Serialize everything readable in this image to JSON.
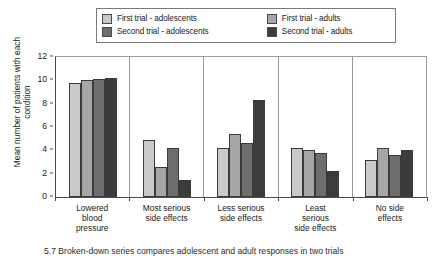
{
  "legend": {
    "entries": [
      {
        "label": "First trial - adolescents",
        "color": "#c9c9c9",
        "key": "first_adolescents"
      },
      {
        "label": "First trial - adults",
        "color": "#a6a6a6",
        "key": "first_adults"
      },
      {
        "label": "Second trial - adolescents",
        "color": "#6e6e6e",
        "key": "second_adolescents"
      },
      {
        "label": "Second trial - adults",
        "color": "#3c3c3c",
        "key": "second_adults"
      }
    ]
  },
  "caption": {
    "text": "5.7  Broken-down series compares adolescent and adult responses in two trials"
  },
  "chart_data": {
    "type": "bar",
    "title": "",
    "xlabel": "",
    "ylabel": "Mean number of patients with each condition",
    "ylim": [
      0,
      12
    ],
    "yticks": [
      0,
      2,
      4,
      6,
      8,
      10,
      12
    ],
    "grid": false,
    "legend_position": "top",
    "categories": [
      "Lowered blood pressure",
      "Most serious side effects",
      "Less serious side effects",
      "Least serious side effects",
      "No side effects"
    ],
    "category_lines": [
      [
        "Lowered",
        "blood",
        "pressure"
      ],
      [
        "Most serious",
        "side effects"
      ],
      [
        "Less serious",
        "side effects"
      ],
      [
        "Least",
        "serious",
        "side effects"
      ],
      [
        "No side",
        "effects"
      ]
    ],
    "series": [
      {
        "name": "First trial - adolescents",
        "color": "#c9c9c9",
        "values": [
          9.8,
          4.9,
          4.2,
          4.2,
          3.2
        ]
      },
      {
        "name": "First trial - adults",
        "color": "#a6a6a6",
        "values": [
          10.0,
          2.6,
          5.4,
          4.0,
          4.2
        ]
      },
      {
        "name": "Second trial - adolescents",
        "color": "#6e6e6e",
        "values": [
          10.1,
          4.2,
          4.6,
          3.8,
          3.6
        ]
      },
      {
        "name": "Second trial - adults",
        "color": "#3c3c3c",
        "values": [
          10.2,
          1.5,
          8.3,
          2.2,
          4.0
        ]
      }
    ]
  }
}
